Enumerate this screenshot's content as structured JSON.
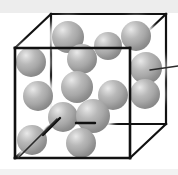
{
  "figure": {
    "type": "3d-cube-particle-diagram",
    "background_color": "#ffffff",
    "top_band_color": "#ededed",
    "bottom_rule_color": "#d8d8d8",
    "edge_color": "#111111",
    "sphere_color": "#a8a8a8",
    "sphere_highlight_color": "#e9e9e9",
    "sphere_shadow_color": "#848484",
    "leader_color": "#2a2a2a",
    "sphere_count": 14,
    "labels": []
  },
  "cube": {
    "name": "unit-cell-cube",
    "front_face": {
      "x": 15,
      "y": 48,
      "w": 115,
      "h": 110
    },
    "back_face": {
      "x": 51,
      "y": 14,
      "w": 115,
      "h": 110
    },
    "connector_offset": {
      "dx": 36,
      "dy": -34
    }
  },
  "spheres": [
    {
      "id": "s1",
      "cx": 68,
      "cy": 37,
      "r": 16
    },
    {
      "id": "s2",
      "cx": 108,
      "cy": 46,
      "r": 14
    },
    {
      "id": "s3",
      "cx": 136,
      "cy": 36,
      "r": 15
    },
    {
      "id": "s4",
      "cx": 31,
      "cy": 62,
      "r": 15
    },
    {
      "id": "s5",
      "cx": 82,
      "cy": 59,
      "r": 15
    },
    {
      "id": "s6",
      "cx": 146,
      "cy": 68,
      "r": 16
    },
    {
      "id": "s7",
      "cx": 77,
      "cy": 87,
      "r": 16
    },
    {
      "id": "s8",
      "cx": 113,
      "cy": 95,
      "r": 15
    },
    {
      "id": "s9",
      "cx": 145,
      "cy": 94,
      "r": 15
    },
    {
      "id": "s10",
      "cx": 38,
      "cy": 96,
      "r": 15
    },
    {
      "id": "s11",
      "cx": 63,
      "cy": 117,
      "r": 15
    },
    {
      "id": "s12",
      "cx": 93,
      "cy": 116,
      "r": 17
    },
    {
      "id": "s13",
      "cx": 32,
      "cy": 140,
      "r": 15
    },
    {
      "id": "s14",
      "cx": 81,
      "cy": 143,
      "r": 15
    }
  ],
  "leaders": [
    {
      "id": "leader-right",
      "x1": 150,
      "y1": 70,
      "x2": 178,
      "y2": 66
    },
    {
      "id": "leader-bottom-left",
      "x1": 18,
      "y1": 158,
      "x2": 57,
      "y2": 119
    }
  ],
  "bonds": [
    {
      "id": "bond-horizontal",
      "x1": 76,
      "y1": 123,
      "x2": 95,
      "y2": 123
    },
    {
      "id": "bond-diagonal",
      "x1": 43,
      "y1": 135,
      "x2": 60,
      "y2": 118
    }
  ]
}
